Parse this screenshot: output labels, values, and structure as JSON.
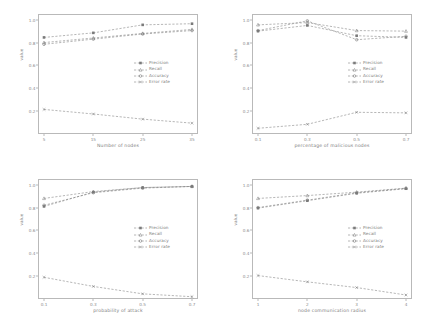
{
  "figure": {
    "series_names": [
      "Precision",
      "Recall",
      "Accuracy",
      "Error rate"
    ],
    "y_axis_label": "value",
    "y_ticks": [
      "0.2",
      "0.4",
      "0.6",
      "0.8",
      "1.0"
    ],
    "ylim": [
      0.0,
      1.05
    ]
  },
  "chart_data": [
    {
      "type": "line",
      "title": "",
      "xlabel": "Number of nodes",
      "ylabel": "value",
      "x": [
        5,
        15,
        25,
        35
      ],
      "xtick_labels": [
        "5",
        "15",
        "25",
        "35"
      ],
      "ylim": [
        0.0,
        1.05
      ],
      "ytick_labels": [
        "0.2",
        "0.4",
        "0.6",
        "0.8",
        "1.0"
      ],
      "grid": false,
      "legend_position": "center-right",
      "series": [
        {
          "name": "Precision",
          "values": [
            0.845,
            0.885,
            0.955,
            0.965
          ]
        },
        {
          "name": "Recall",
          "values": [
            0.8,
            0.84,
            0.88,
            0.915
          ]
        },
        {
          "name": "Accuracy",
          "values": [
            0.785,
            0.83,
            0.875,
            0.905
          ]
        },
        {
          "name": "Error rate",
          "values": [
            0.215,
            0.175,
            0.13,
            0.095
          ]
        }
      ]
    },
    {
      "type": "line",
      "title": "",
      "xlabel": "percentage of malicious nodes",
      "ylabel": "value",
      "x": [
        0.1,
        0.3,
        0.5,
        0.7
      ],
      "xtick_labels": [
        "0.1",
        "0.3",
        "0.5",
        "0.7"
      ],
      "ylim": [
        0.0,
        1.05
      ],
      "ytick_labels": [
        "0.2",
        "0.4",
        "0.6",
        "0.8",
        "1.0"
      ],
      "grid": false,
      "legend_position": "center-right",
      "series": [
        {
          "name": "Precision",
          "values": [
            0.9,
            0.95,
            0.86,
            0.845
          ]
        },
        {
          "name": "Recall",
          "values": [
            0.955,
            0.975,
            0.905,
            0.9
          ]
        },
        {
          "name": "Accuracy",
          "values": [
            0.905,
            0.99,
            0.825,
            0.855
          ]
        },
        {
          "name": "Error rate",
          "values": [
            0.05,
            0.085,
            0.19,
            0.185
          ]
        }
      ]
    },
    {
      "type": "line",
      "title": "",
      "xlabel": "probability of attack",
      "ylabel": "value",
      "x": [
        0.1,
        0.3,
        0.5,
        0.7
      ],
      "xtick_labels": [
        "0.1",
        "0.3",
        "0.5",
        "0.7"
      ],
      "ylim": [
        0.0,
        1.05
      ],
      "ytick_labels": [
        "0.2",
        "0.4",
        "0.6",
        "0.8",
        "1.0"
      ],
      "grid": false,
      "legend_position": "center-right",
      "series": [
        {
          "name": "Precision",
          "values": [
            0.81,
            0.935,
            0.975,
            0.985
          ]
        },
        {
          "name": "Recall",
          "values": [
            0.88,
            0.94,
            0.975,
            0.985
          ]
        },
        {
          "name": "Accuracy",
          "values": [
            0.82,
            0.93,
            0.97,
            0.985
          ]
        },
        {
          "name": "Error rate",
          "values": [
            0.19,
            0.11,
            0.045,
            0.02
          ]
        }
      ]
    },
    {
      "type": "line",
      "title": "",
      "xlabel": "node communication radius",
      "ylabel": "value",
      "x": [
        1,
        2,
        3,
        4
      ],
      "xtick_labels": [
        "1",
        "2",
        "3",
        "4"
      ],
      "ylim": [
        0.0,
        1.05
      ],
      "ytick_labels": [
        "0.2",
        "0.4",
        "0.6",
        "0.8",
        "1.0"
      ],
      "grid": false,
      "legend_position": "center-right",
      "series": [
        {
          "name": "Precision",
          "values": [
            0.795,
            0.86,
            0.925,
            0.965
          ]
        },
        {
          "name": "Recall",
          "values": [
            0.88,
            0.905,
            0.935,
            0.97
          ]
        },
        {
          "name": "Accuracy",
          "values": [
            0.8,
            0.865,
            0.93,
            0.968
          ]
        },
        {
          "name": "Error rate",
          "values": [
            0.205,
            0.15,
            0.1,
            0.035
          ]
        }
      ]
    }
  ]
}
